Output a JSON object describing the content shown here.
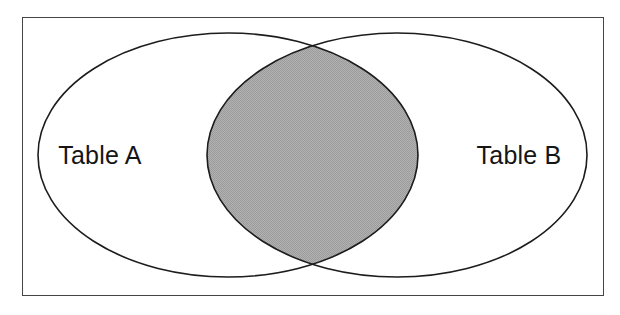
{
  "diagram": {
    "type": "venn-two-set",
    "title_visible": false,
    "canvas": {
      "width": 620,
      "height": 315,
      "background": "#ffffff"
    },
    "frame": {
      "name": "outer-border",
      "x": 22,
      "y": 17,
      "width": 582,
      "height": 279,
      "stroke": "#454545",
      "stroke_width": 1,
      "fill": "#ffffff"
    },
    "sets": [
      {
        "id": "set-a",
        "label": "Table A",
        "label_x": 100,
        "label_y": 164,
        "center_x": 228,
        "center_y": 155,
        "radius_x": 190,
        "radius_y": 122,
        "fill": "#ffffff",
        "stroke": "#1c1c1c",
        "stroke_width": 1.6
      },
      {
        "id": "set-b",
        "label": "Table B",
        "label_x": 519,
        "label_y": 164,
        "center_x": 397,
        "center_y": 155,
        "radius_x": 190,
        "radius_y": 122,
        "fill": "#ffffff",
        "stroke": "#1c1c1c",
        "stroke_width": 1.6
      }
    ],
    "intersection": {
      "name": "inner-join-region",
      "shaded": true,
      "fill": "#a8a8a8",
      "pattern": "dither-checkerboard",
      "stroke": "#1c1c1c",
      "stroke_width": 1.6,
      "crossing_top_x": 312,
      "crossing_top_y": 42,
      "crossing_bottom_x": 312,
      "crossing_bottom_y": 268
    },
    "colors": {
      "shade_gray": "#a8a8a8",
      "shade_gray_light": "#bdbdbd",
      "outline_black": "#1c1c1c",
      "frame_gray": "#454545",
      "background_white": "#ffffff",
      "text_black": "#151515"
    }
  }
}
